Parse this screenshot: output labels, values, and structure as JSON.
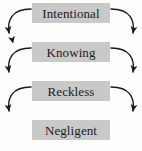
{
  "diagram": {
    "type": "flowchart-vertical-hierarchy",
    "background_color": "#fdfdfb",
    "node_fill_color": "#c9c9c9",
    "arrow_color": "#1a1a1a",
    "nodes": [
      {
        "id": "intentional",
        "label": "Intentional"
      },
      {
        "id": "knowing",
        "label": "Knowing"
      },
      {
        "id": "reckless",
        "label": "Reckless"
      },
      {
        "id": "negligent",
        "label": "Negligent"
      }
    ],
    "connectors": [
      {
        "from": "intentional",
        "to": "knowing",
        "side": "left",
        "shape": "curved-arrow",
        "head": "right"
      },
      {
        "from": "intentional",
        "to": "knowing",
        "side": "right",
        "shape": "curved-arrow",
        "head": "left"
      },
      {
        "from": "knowing",
        "to": "reckless",
        "side": "left",
        "shape": "curved-arrow",
        "head": "right"
      },
      {
        "from": "knowing",
        "to": "reckless",
        "side": "right",
        "shape": "curved-arrow",
        "head": "left"
      },
      {
        "from": "reckless",
        "to": "negligent",
        "side": "left",
        "shape": "curved-arrow",
        "head": "right"
      },
      {
        "from": "reckless",
        "to": "negligent",
        "side": "right",
        "shape": "curved-arrow",
        "head": "left"
      }
    ]
  }
}
